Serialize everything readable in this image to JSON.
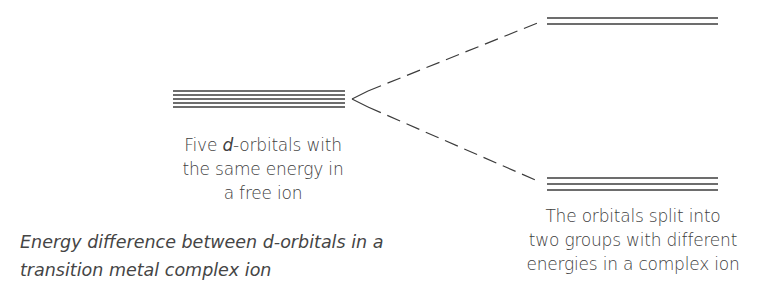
{
  "diagram": {
    "type": "d-orbital splitting diagram",
    "free_ion": {
      "orbital_count": 5,
      "label_part1": "Five ",
      "label_italic": "d",
      "label_part2": "-orbitals with",
      "label_line2": "the same energy in",
      "label_line3": "a free ion"
    },
    "complex_ion": {
      "upper_group_count": 2,
      "lower_group_count": 3,
      "label_line1": "The orbitals split into",
      "label_line2": "two groups with different",
      "label_line3": "energies in a complex ion"
    },
    "caption": {
      "line1": "Energy difference between d-orbitals in a",
      "line2": "transition metal complex ion"
    },
    "colors": {
      "line": "#3c3c3c",
      "text": "#404040",
      "background": "#ffffff"
    }
  }
}
